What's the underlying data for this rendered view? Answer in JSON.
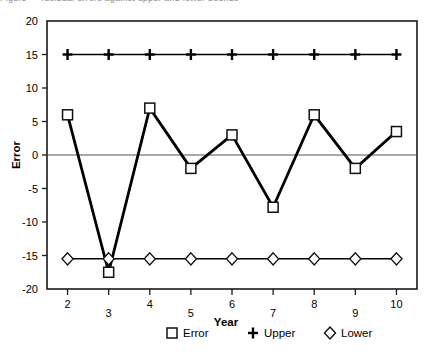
{
  "top_clipped_text": "Figure  — residual errors against upper and lower bounds",
  "chart_data": {
    "type": "line",
    "title": "",
    "xlabel": "Year",
    "ylabel": "Error",
    "x": [
      2,
      3,
      4,
      5,
      6,
      7,
      8,
      9,
      10
    ],
    "xticklabels": [
      "2",
      "3",
      "4",
      "5",
      "6",
      "7",
      "8",
      "9",
      "10"
    ],
    "yticklabels": [
      "20",
      "15",
      "10",
      "5",
      "0",
      "-5",
      "-10",
      "-15",
      "-20"
    ],
    "yticks": [
      20,
      15,
      10,
      5,
      0,
      -5,
      -10,
      -15,
      -20
    ],
    "xlim": [
      1.5,
      10.5
    ],
    "ylim": [
      -20,
      20
    ],
    "grid": false,
    "zero_line": true,
    "legend_position": "bottom",
    "series": [
      {
        "name": "Error",
        "marker": "square",
        "values": [
          6.0,
          -17.5,
          7.0,
          -2.0,
          3.0,
          -7.8,
          6.0,
          -2.0,
          3.5
        ]
      },
      {
        "name": "Upper",
        "marker": "plus",
        "values": [
          15,
          15,
          15,
          15,
          15,
          15,
          15,
          15,
          15
        ]
      },
      {
        "name": "Lower",
        "marker": "diamond",
        "values": [
          -15.5,
          -15.5,
          -15.5,
          -15.5,
          -15.5,
          -15.5,
          -15.5,
          -15.5,
          -15.5
        ]
      }
    ]
  },
  "legend": [
    {
      "label": "Error",
      "marker": "square-marker"
    },
    {
      "label": "Upper",
      "marker": "plus-marker"
    },
    {
      "label": "Lower",
      "marker": "diamond-marker"
    }
  ],
  "colors": {
    "line": "#000000",
    "frame": "#1a1a1a",
    "zero_line": "#555555",
    "background": "#ffffff"
  }
}
